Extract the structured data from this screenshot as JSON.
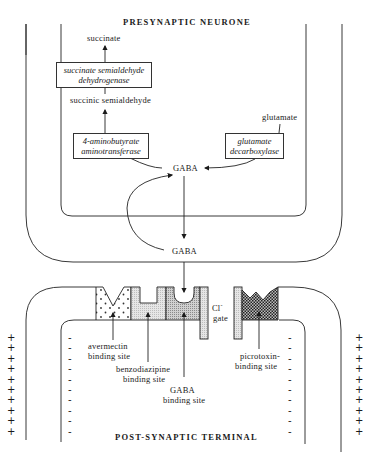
{
  "diagram": {
    "presynaptic": {
      "title": "PRESYNAPTIC NEURONE",
      "metabolites": {
        "succinate": "succinate",
        "succinic_semialdehyde": "succinic semialdehyde",
        "glutamate": "glutamate",
        "gaba_inside": "GABA"
      },
      "enzymes": {
        "ssadh_line1": "succinate semialdehyde",
        "ssadh_line2": "dehydrogenase",
        "gabat_line1": "4-aminobutyrate",
        "gabat_line2": "aminotransferase",
        "gad_line1": "glutamate",
        "gad_line2": "decarboxylase"
      }
    },
    "cleft": {
      "gaba_released": "GABA"
    },
    "receptor": {
      "chloride_line1": "Cl",
      "chloride_sup": "-",
      "chloride_line2": "gate",
      "sites": {
        "avermectin_line1": "avermectin",
        "avermectin_line2": "binding site",
        "benzodiazepine_line1": "benzodiazipine",
        "benzodiazepine_line2": "binding site",
        "gaba_line1": "GABA",
        "gaba_line2": "binding site",
        "picrotoxin_line1": "picrotoxin-",
        "picrotoxin_line2": "binding site"
      }
    },
    "postsynaptic": {
      "title": "POST-SYNAPTIC TERMINAL",
      "outside_charge": "+",
      "inside_charge": "-",
      "charge_rows": 10
    }
  }
}
